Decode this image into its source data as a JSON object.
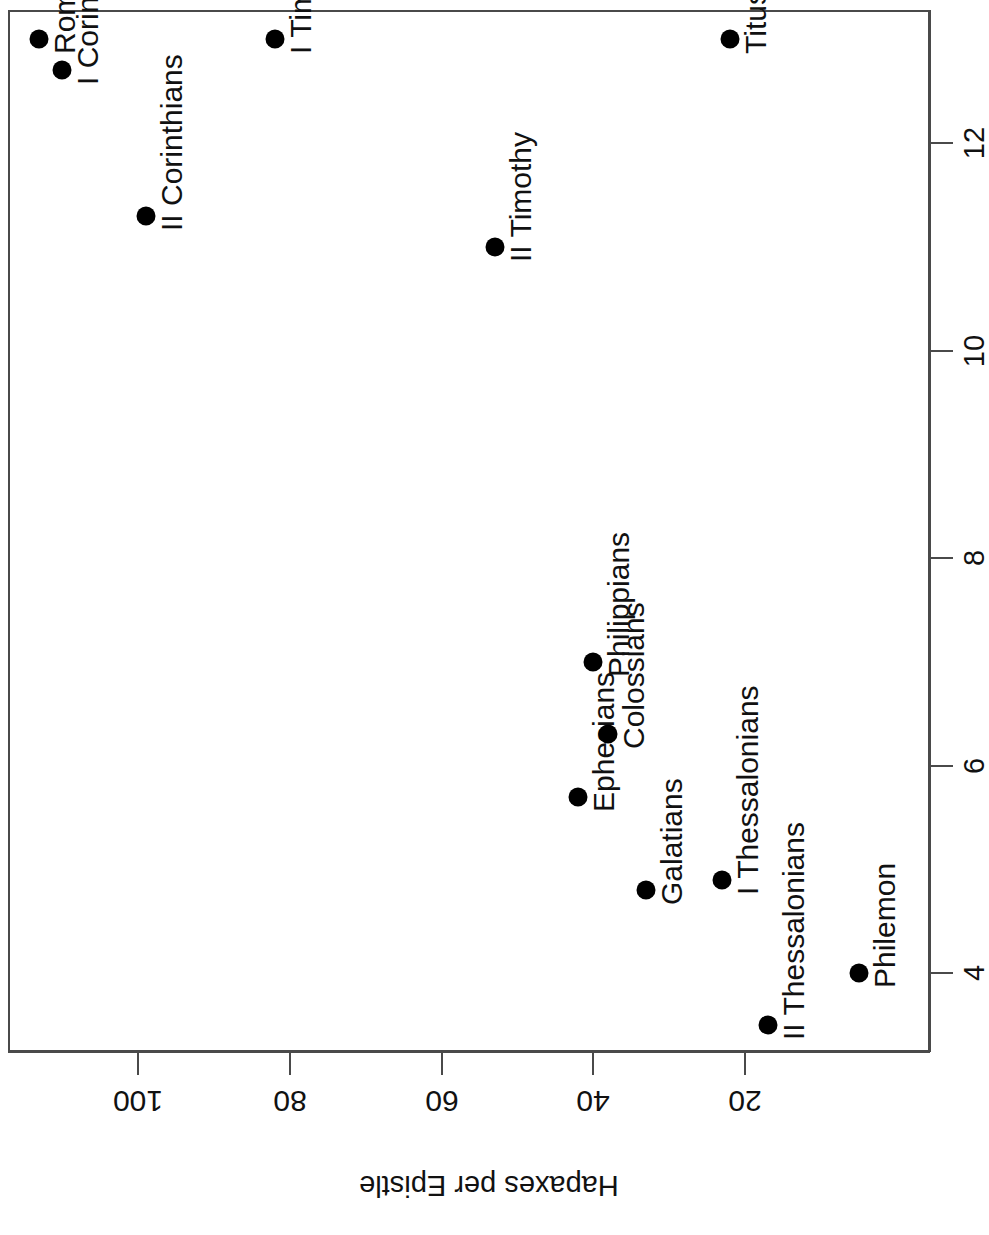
{
  "chart_data": {
    "type": "scatter",
    "title": "",
    "xlabel": "",
    "ylabel": "Hapaxes per Epistle",
    "xlim": [
      3.3,
      13.3
    ],
    "ylim": [
      10,
      118
    ],
    "xticks": [
      4,
      6,
      8,
      10,
      12
    ],
    "yticks": [
      20,
      40,
      60,
      80,
      100
    ],
    "grid": false,
    "legend": "none",
    "point_label_field": "label",
    "x_field": "chapters",
    "y_field": "hapaxes",
    "points": [
      {
        "label": "Romans",
        "chapters": 13.0,
        "hapaxes": 113
      },
      {
        "label": "I Corinthians",
        "chapters": 12.7,
        "hapaxes": 110
      },
      {
        "label": "II Corinthians",
        "chapters": 11.3,
        "hapaxes": 99
      },
      {
        "label": "Galatians",
        "chapters": 4.8,
        "hapaxes": 33
      },
      {
        "label": "Ephesians",
        "chapters": 5.7,
        "hapaxes": 42
      },
      {
        "label": "Philippians",
        "chapters": 7.0,
        "hapaxes": 40
      },
      {
        "label": "Colossians",
        "chapters": 6.3,
        "hapaxes": 38
      },
      {
        "label": "I Thessalonians",
        "chapters": 4.9,
        "hapaxes": 23
      },
      {
        "label": "II Thessalonians",
        "chapters": 3.5,
        "hapaxes": 17
      },
      {
        "label": "I Timothy",
        "chapters": 13.0,
        "hapaxes": 82
      },
      {
        "label": "II Timothy",
        "chapters": 11.0,
        "hapaxes": 53
      },
      {
        "label": "Titus",
        "chapters": 13.0,
        "hapaxes": 22
      },
      {
        "label": "Philemon",
        "chapters": 4.0,
        "hapaxes": 5
      }
    ]
  },
  "axes": {
    "x_tick_labels": [
      "4",
      "6",
      "8",
      "10",
      "12"
    ],
    "y_tick_labels": [
      "100",
      "80",
      "60",
      "40",
      "20"
    ],
    "y_axis_title": "Hapaxes per Epistle"
  },
  "point_labels": [
    "Romans",
    "I Corinthians",
    "II Corinthians",
    "Galatians",
    "Ephesians",
    "Philippians",
    "Colossians",
    "I Thessalonians",
    "II Thessalonians",
    "I Timothy",
    "II Timothy",
    "Titus",
    "Philemon"
  ],
  "colors": {
    "point": "#000000",
    "axis": "#4a4a4a",
    "text": "#111111",
    "background": "#ffffff"
  }
}
